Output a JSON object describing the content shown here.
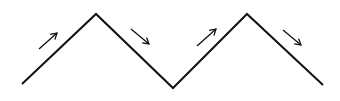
{
  "diagram": {
    "type": "zigzag-motion",
    "stroke_color": "#111111",
    "line_points": [
      [
        22,
        84
      ],
      [
        96,
        14
      ],
      [
        173,
        88
      ],
      [
        247,
        14
      ],
      [
        323,
        85
      ]
    ],
    "arrows": [
      {
        "direction": "up-right",
        "from": [
          39,
          49
        ],
        "to": [
          57,
          33
        ]
      },
      {
        "direction": "down-right",
        "from": [
          131,
          29
        ],
        "to": [
          149,
          44
        ]
      },
      {
        "direction": "up-right",
        "from": [
          197,
          46
        ],
        "to": [
          216,
          29
        ]
      },
      {
        "direction": "down-right",
        "from": [
          283,
          30
        ],
        "to": [
          301,
          45
        ]
      }
    ]
  }
}
